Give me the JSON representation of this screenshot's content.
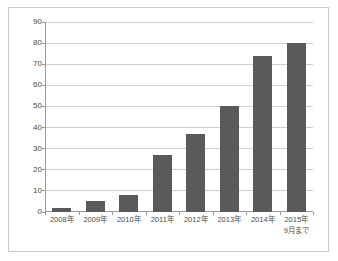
{
  "chart_data": {
    "type": "bar",
    "title": "",
    "subtitle": "",
    "xlabel": "",
    "ylabel": "",
    "ylim": [
      0,
      90
    ],
    "ytick_step": 10,
    "yticks": [
      "0",
      "10",
      "20",
      "30",
      "40",
      "50",
      "60",
      "70",
      "80",
      "90"
    ],
    "grid": true,
    "legend": false,
    "legend_position": "none",
    "orientation": "vertical",
    "categories": [
      "2008年",
      "2009年",
      "2010年",
      "2011年",
      "2012年",
      "2013年",
      "2014年",
      "2015年"
    ],
    "category_sublabels": [
      "",
      "",
      "",
      "",
      "",
      "",
      "",
      "9月まで"
    ],
    "values": [
      2,
      5,
      8,
      27,
      37,
      50,
      74,
      80
    ],
    "colors": {
      "bar": "#5a5a5a",
      "gridline": "#cfcfcf",
      "axis": "#9a9a9a",
      "frame_border": "#c9c9c9",
      "background": "#ffffff",
      "tick_text": "#4a4a4a"
    }
  }
}
